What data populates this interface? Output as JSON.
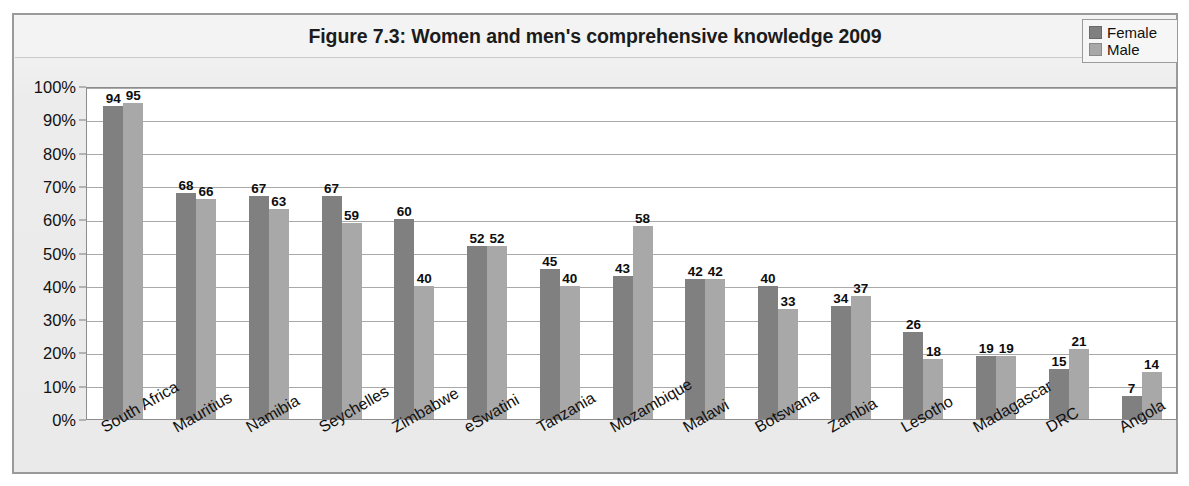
{
  "chart_data": {
    "type": "bar",
    "title": "Figure 7.3: Women and men's comprehensive knowledge 2009",
    "xlabel": "",
    "ylabel": "",
    "ylim": [
      0,
      100
    ],
    "y_tick_labels": [
      "100%",
      "90%",
      "80%",
      "70%",
      "60%",
      "50%",
      "40%",
      "30%",
      "20%",
      "10%",
      "0%"
    ],
    "y_tick_values": [
      100,
      90,
      80,
      70,
      60,
      50,
      40,
      30,
      20,
      10,
      0
    ],
    "grid": true,
    "legend_position": "top-right",
    "categories": [
      "South Africa",
      "Mauritius",
      "Namibia",
      "Seychelles",
      "Zimbabwe",
      "eSwatini",
      "Tanzania",
      "Mozambique",
      "Malawi",
      "Botswana",
      "Zambia",
      "Lesotho",
      "Madagascar",
      "DRC",
      "Angola"
    ],
    "series": [
      {
        "name": "Female",
        "color": "#808080",
        "values": [
          94,
          68,
          67,
          67,
          60,
          52,
          45,
          43,
          42,
          40,
          34,
          26,
          19,
          15,
          7
        ]
      },
      {
        "name": "Male",
        "color": "#a8a8a8",
        "values": [
          95,
          66,
          63,
          59,
          40,
          52,
          40,
          58,
          42,
          33,
          37,
          18,
          19,
          21,
          14
        ]
      }
    ]
  },
  "legend": {
    "items": [
      {
        "label": "Female",
        "color": "#808080",
        "icon": "legend-swatch-icon"
      },
      {
        "label": "Male",
        "color": "#a8a8a8",
        "icon": "legend-swatch-icon"
      }
    ]
  },
  "colors": {
    "female": "#808080",
    "male": "#a8a8a8",
    "plot_background": "#ffffff",
    "chart_background": "#e9e9e9",
    "gridline": "#a9a9a9",
    "frame_border": "#9a9a9a",
    "text": "#111111"
  }
}
